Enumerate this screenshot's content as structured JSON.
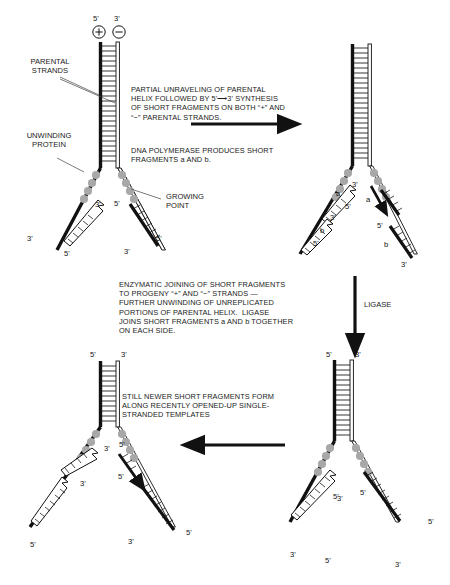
{
  "figure": {
    "background_color": "#ffffff",
    "ink_color": "#000000",
    "template_strand_color": "#111111",
    "new_strand_outline_color": "#222222",
    "unwinding_protein_color": "#9a9a9a"
  },
  "top_polarity": {
    "five_prime": "5'",
    "three_prime": "3'",
    "plus_sign": "+",
    "minus_sign": "−"
  },
  "callouts": {
    "parental_strands": "PARENTAL\nSTRANDS",
    "unwinding_protein": "UNWINDING\nPROTEIN",
    "growing_point": "GROWING\nPOINT"
  },
  "text_blocks": [
    {
      "id": "step1-unraveling",
      "text": "PARTIAL UNRAVELING OF PARENTAL\nHELIX FOLLOWED BY 5'⟶3' SYNTHESIS\nOF SHORT FRAGMENTS ON BOTH “+” AND\n“−” PARENTAL STRANDS."
    },
    {
      "id": "step1-polymerase",
      "text": "DNA POLYMERASE PRODUCES SHORT\nFRAGMENTS a AND b."
    },
    {
      "id": "step2-ligase",
      "text": "ENZYMATIC JOINING OF SHORT FRAGMENTS\nTO PROGENY “+” AND “−” STRANDS —\nFURTHER UNWINDING OF UNREPLICATED\nPORTIONS OF PARENTAL HELIX.  LIGASE\nJOINS SHORT FRAGMENTS a AND b TOGETHER\nON EACH SIDE."
    },
    {
      "id": "step3-newer-fragments",
      "text": "STILL NEWER SHORT FRAGMENTS FORM\nALONG RECENTLY OPENED-UP SINGLE-\nSTRANDED TEMPLATES"
    }
  ],
  "arrows": [
    {
      "id": "arrow-step1-right",
      "label": "",
      "direction": "right"
    },
    {
      "id": "arrow-step2-down",
      "label": "LIGASE",
      "direction": "down"
    },
    {
      "id": "arrow-step3-left",
      "label": "",
      "direction": "left"
    }
  ],
  "panels": [
    {
      "id": "panel-1",
      "position": "top-left",
      "top_labels": [
        {
          "text": "5'",
          "strand": "plus"
        },
        {
          "text": "3'",
          "strand": "minus"
        }
      ],
      "fragment_labels": [],
      "end_labels": [
        "3'",
        "5'",
        "3'",
        "5'",
        "3'",
        "5'"
      ]
    },
    {
      "id": "panel-2",
      "position": "top-right",
      "top_labels": [],
      "fragment_labels": [
        "a",
        "a",
        "b",
        "b"
      ],
      "end_labels": [
        "3'",
        "5'",
        "3'",
        "5'",
        "5'",
        "3'"
      ]
    },
    {
      "id": "panel-3",
      "position": "bottom-right",
      "top_labels": [
        {
          "text": "5'",
          "strand": "plus"
        },
        {
          "text": "3'",
          "strand": "minus"
        }
      ],
      "fragment_labels": [],
      "end_labels": [
        "3'",
        "5'",
        "3'",
        "5'",
        "5'",
        "3'"
      ]
    },
    {
      "id": "panel-4",
      "position": "bottom-left",
      "top_labels": [
        {
          "text": "5'",
          "strand": "plus"
        },
        {
          "text": "3'",
          "strand": "minus"
        }
      ],
      "fragment_labels": [],
      "end_labels": [
        "3'",
        "5'",
        "3'",
        "5'",
        "5'",
        "3'"
      ]
    }
  ],
  "prime_marks": {
    "five": "5'",
    "three": "3'",
    "a": "a",
    "b": "b"
  }
}
